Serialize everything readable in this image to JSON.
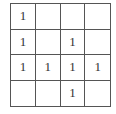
{
  "grid": {
    "rows": 4,
    "cols": 4,
    "cells": [
      [
        "1",
        "",
        "",
        ""
      ],
      [
        "1",
        "",
        "1",
        ""
      ],
      [
        "1",
        "1",
        "1",
        "1"
      ],
      [
        "",
        "",
        "1",
        ""
      ]
    ]
  },
  "colors": {
    "line": "#555555",
    "text": "#333333",
    "background": "#ffffff"
  }
}
